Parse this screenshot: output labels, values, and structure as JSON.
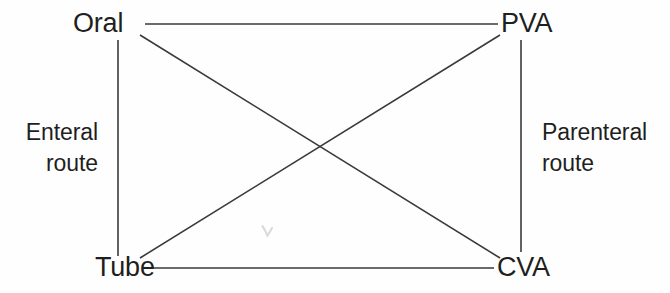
{
  "figure": {
    "type": "diagram",
    "subtype": "nutrition-support-route-crossover",
    "background_color": "#fefefe",
    "line_color": "#3a3a3a",
    "text_color": "#1f1f1f",
    "width": 670,
    "height": 293
  },
  "nodes": {
    "oral": {
      "label": "Oral",
      "x": 110,
      "y": 24,
      "corner": "top-left"
    },
    "pva": {
      "label": "PVA",
      "x": 526,
      "y": 24,
      "corner": "top-right"
    },
    "tube": {
      "label": "Tube",
      "x": 120,
      "y": 268,
      "corner": "bottom-left"
    },
    "cva": {
      "label": "CVA",
      "x": 521,
      "y": 268,
      "corner": "bottom-right"
    }
  },
  "route_labels": {
    "left": {
      "line1": "Enteral",
      "line2": "route"
    },
    "right": {
      "line1": "Parenteral",
      "line2": "route"
    }
  },
  "connections": [
    {
      "name": "oral-to-pva",
      "from": "oral",
      "to": "pva",
      "kind": "horizontal-top"
    },
    {
      "name": "tube-to-cva",
      "from": "tube",
      "to": "cva",
      "kind": "horizontal-bottom"
    },
    {
      "name": "oral-to-tube",
      "from": "oral",
      "to": "tube",
      "kind": "vertical-left"
    },
    {
      "name": "pva-to-cva",
      "from": "pva",
      "to": "cva",
      "kind": "vertical-right"
    },
    {
      "name": "oral-to-cva",
      "from": "oral",
      "to": "cva",
      "kind": "diagonal-descending"
    },
    {
      "name": "tube-to-pva",
      "from": "tube",
      "to": "pva",
      "kind": "diagonal-ascending"
    }
  ],
  "geometry": {
    "top_line": {
      "x1": 145,
      "y1": 24,
      "x2": 498,
      "y2": 24
    },
    "bottom_line": {
      "x1": 150,
      "y1": 268,
      "x2": 494,
      "y2": 268
    },
    "left_line": {
      "x1": 118,
      "y1": 40,
      "x2": 118,
      "y2": 256
    },
    "right_line": {
      "x1": 521,
      "y1": 40,
      "x2": 521,
      "y2": 252
    },
    "diagonal_down": {
      "x1": 140,
      "y1": 35,
      "x2": 500,
      "y2": 258
    },
    "diagonal_up": {
      "x1": 140,
      "y1": 258,
      "x2": 500,
      "y2": 35
    },
    "crossing_point": {
      "x": 320,
      "y": 148
    }
  }
}
